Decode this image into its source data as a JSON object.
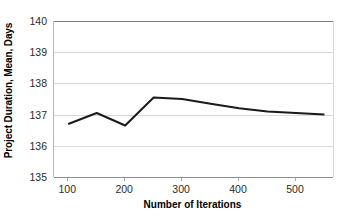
{
  "chart_data": {
    "type": "line",
    "title": "",
    "xlabel": "Number of Iterations",
    "ylabel": "Project Duration, Mean, Days",
    "xlim": [
      75,
      565
    ],
    "ylim": [
      135,
      140
    ],
    "grid": true,
    "legend": false,
    "legend_position": "none",
    "x_ticks": [
      100,
      200,
      300,
      400,
      500
    ],
    "x_tick_labels": [
      "100",
      "200",
      "300",
      "400",
      "500"
    ],
    "y_ticks": [
      135,
      136,
      137,
      138,
      139,
      140
    ],
    "y_tick_labels": [
      "135",
      "136",
      "137",
      "138",
      "139",
      "140"
    ],
    "x": [
      100,
      150,
      200,
      250,
      300,
      350,
      400,
      450,
      500,
      550
    ],
    "series": [
      {
        "name": "Project Duration Mean",
        "color": "#1a1a1a",
        "line_width": 2,
        "marker": "none",
        "values": [
          136.7,
          137.05,
          136.65,
          137.55,
          137.5,
          137.35,
          137.2,
          137.1,
          137.05,
          137.0
        ]
      }
    ]
  },
  "axis_style": {
    "gridline_color": "#d9d9d9",
    "axis_color": "#808080",
    "tick_color": "#a6a6a6",
    "text_color": "#2b2b2b",
    "background": "#ffffff"
  }
}
